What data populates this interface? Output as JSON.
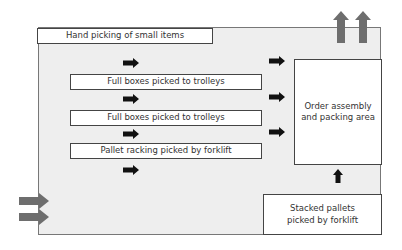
{
  "diagram": {
    "zones": {
      "hand_picking": "Hand picking of small items",
      "full_boxes_1": "Full boxes picked to trolleys",
      "full_boxes_2": "Full boxes picked to trolleys",
      "pallet_racking": "Pallet racking picked by forklift",
      "order_assembly": "Order assembly and packing area",
      "stacked_pallets": "Stacked pallets picked by forklift"
    },
    "flows": {
      "inbound": "inbound-goods-arrows",
      "outbound": "outbound-goods-arrows"
    },
    "colors": {
      "floor": "#eeeeee",
      "big_arrow": "#6e6e6e",
      "small_arrow": "#111111",
      "box_border": "#444444"
    }
  }
}
